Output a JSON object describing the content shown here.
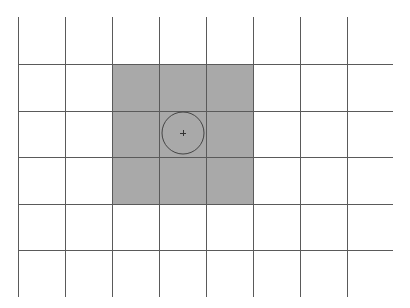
{
  "diagram": {
    "type": "grid-with-highlight",
    "background": "#ffffff",
    "grid": {
      "line_color": "#5a5a5a",
      "line_width": 1,
      "vertical_lines_x": [
        18,
        65,
        112,
        159,
        206,
        253,
        300,
        347
      ],
      "vertical_extent": [
        17,
        297
      ],
      "horizontal_lines_y": [
        64,
        111,
        157,
        204,
        250
      ],
      "horizontal_extent": [
        18,
        393
      ]
    },
    "highlight_region": {
      "x": 112,
      "y": 64,
      "width": 141,
      "height": 140,
      "fill": "#a9a9a9"
    },
    "circle": {
      "cx": 183,
      "cy": 133,
      "r": 21,
      "stroke": "#444444"
    },
    "center_marker": {
      "x": 183,
      "y": 133,
      "size": 3,
      "symbol": "plus",
      "stroke": "#333333"
    }
  }
}
